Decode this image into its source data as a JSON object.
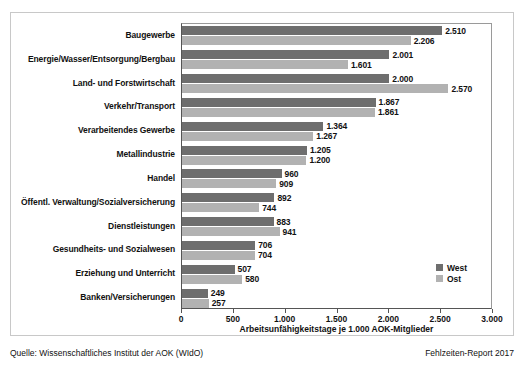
{
  "chart_data": {
    "type": "bar",
    "orientation": "horizontal",
    "title": "",
    "xlabel": "Arbeitsunfähigkeitstage je 1.000 AOK-Mitglieder",
    "ylabel": "",
    "xlim": [
      0,
      3000
    ],
    "xticks": [
      0,
      500,
      1000,
      1500,
      2000,
      2500,
      3000
    ],
    "xticklabels": [
      "0",
      "500",
      "1.000",
      "1.500",
      "2.000",
      "2.500",
      "3.000"
    ],
    "grid": false,
    "legend_position": "right-bottom",
    "categories": [
      "Baugewerbe",
      "Energie/Wasser/Entsorgung/Bergbau",
      "Land- und Forstwirtschaft",
      "Verkehr/Transport",
      "Verarbeitendes Gewerbe",
      "Metallindustrie",
      "Handel",
      "Öffentl. Verwaltung/Sozialversicherung",
      "Dienstleistungen",
      "Gesundheits- und Sozialwesen",
      "Erziehung und Unterricht",
      "Banken/Versicherungen"
    ],
    "series": [
      {
        "name": "West",
        "color": "#6e6e6e",
        "values": [
          2510,
          2001,
          2000,
          1867,
          1364,
          1205,
          960,
          892,
          883,
          706,
          507,
          249
        ],
        "labels": [
          "2.510",
          "2.001",
          "2.000",
          "1.867",
          "1.364",
          "1.205",
          "960",
          "892",
          "883",
          "706",
          "507",
          "249"
        ]
      },
      {
        "name": "Ost",
        "color": "#b2b2b2",
        "values": [
          2206,
          1601,
          2570,
          1861,
          1267,
          1200,
          909,
          744,
          941,
          704,
          580,
          257
        ],
        "labels": [
          "2.206",
          "1.601",
          "2.570",
          "1.861",
          "1.267",
          "1.200",
          "909",
          "744",
          "941",
          "704",
          "580",
          "257"
        ]
      }
    ]
  },
  "legend": {
    "items": [
      {
        "label": "West",
        "color": "#6e6e6e"
      },
      {
        "label": "Ost",
        "color": "#b2b2b2"
      }
    ]
  },
  "footer": {
    "source": "Quelle: Wissenschaftliches Institut der AOK (WIdO)",
    "report": "Fehlzeiten-Report 2017"
  }
}
